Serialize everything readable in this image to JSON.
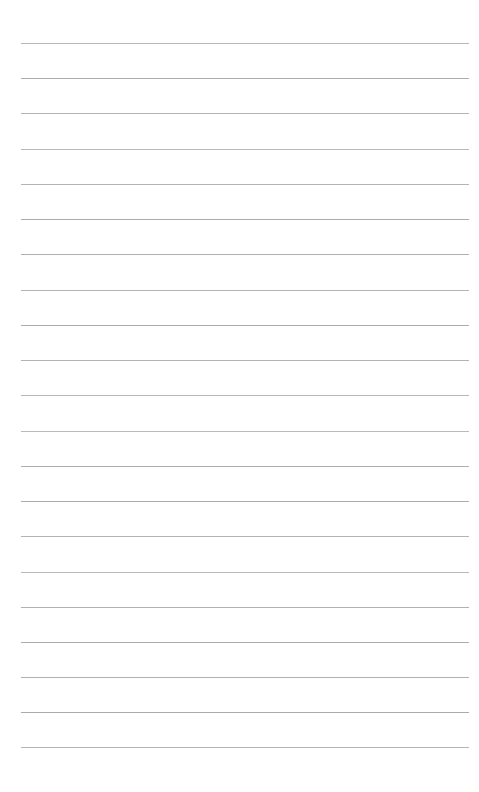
{
  "page": {
    "name": "blank-lined-paper",
    "width_px": 479,
    "height_px": 792,
    "background_color": "#ffffff",
    "content_text": "",
    "written_text": "",
    "is_blank": true
  },
  "rules": {
    "count": 21,
    "color": "#8a8a8a",
    "thickness_px": 1,
    "left_x_px": 21,
    "right_x_px": 469,
    "length_px": 448,
    "first_line_y_px": 43,
    "last_line_y_px": 747,
    "spacing_px": 35.2,
    "lines": [
      {
        "index": 1,
        "y": 43,
        "opacity": 0.62
      },
      {
        "index": 2,
        "y": 78,
        "opacity": 0.7
      },
      {
        "index": 3,
        "y": 113,
        "opacity": 0.66
      },
      {
        "index": 4,
        "y": 149,
        "opacity": 0.6
      },
      {
        "index": 5,
        "y": 184,
        "opacity": 0.64
      },
      {
        "index": 6,
        "y": 219,
        "opacity": 0.72
      },
      {
        "index": 7,
        "y": 254,
        "opacity": 0.68
      },
      {
        "index": 8,
        "y": 290,
        "opacity": 0.63
      },
      {
        "index": 9,
        "y": 325,
        "opacity": 0.7
      },
      {
        "index": 10,
        "y": 360,
        "opacity": 0.66
      },
      {
        "index": 11,
        "y": 395,
        "opacity": 0.61
      },
      {
        "index": 12,
        "y": 431,
        "opacity": 0.58
      },
      {
        "index": 13,
        "y": 466,
        "opacity": 0.69
      },
      {
        "index": 14,
        "y": 501,
        "opacity": 0.71
      },
      {
        "index": 15,
        "y": 536,
        "opacity": 0.65
      },
      {
        "index": 16,
        "y": 572,
        "opacity": 0.6
      },
      {
        "index": 17,
        "y": 607,
        "opacity": 0.67
      },
      {
        "index": 18,
        "y": 642,
        "opacity": 0.7
      },
      {
        "index": 19,
        "y": 677,
        "opacity": 0.68
      },
      {
        "index": 20,
        "y": 712,
        "opacity": 0.72
      },
      {
        "index": 21,
        "y": 747,
        "opacity": 0.64
      }
    ]
  },
  "margins": {
    "top_px": 43,
    "bottom_px": 45,
    "left_px": 21,
    "right_px": 10
  }
}
